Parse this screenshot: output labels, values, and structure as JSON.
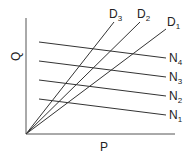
{
  "diagram": {
    "axes": {
      "x_label": "P",
      "y_label": "Q",
      "origin": [
        26,
        134
      ],
      "x_end": [
        175,
        134
      ],
      "y_end": [
        26,
        18
      ]
    },
    "d_lines": [
      {
        "name": "D",
        "sub": "3",
        "from": [
          26,
          134
        ],
        "to": [
          114,
          22
        ],
        "label_pos": [
          109,
          18
        ]
      },
      {
        "name": "D",
        "sub": "2",
        "from": [
          26,
          134
        ],
        "to": [
          140,
          22
        ],
        "label_pos": [
          137,
          18
        ]
      },
      {
        "name": "D",
        "sub": "1",
        "from": [
          26,
          134
        ],
        "to": [
          166,
          29
        ],
        "label_pos": [
          167,
          26
        ]
      }
    ],
    "n_lines": [
      {
        "name": "N",
        "sub": "4",
        "from": [
          39,
          42
        ],
        "to": [
          166,
          58
        ],
        "label_pos": [
          169,
          62
        ]
      },
      {
        "name": "N",
        "sub": "3",
        "from": [
          39,
          61
        ],
        "to": [
          166,
          77
        ],
        "label_pos": [
          169,
          81
        ]
      },
      {
        "name": "N",
        "sub": "2",
        "from": [
          39,
          80
        ],
        "to": [
          166,
          96
        ],
        "label_pos": [
          169,
          100
        ]
      },
      {
        "name": "N",
        "sub": "1",
        "from": [
          39,
          99
        ],
        "to": [
          166,
          115
        ],
        "label_pos": [
          169,
          119
        ]
      }
    ]
  }
}
